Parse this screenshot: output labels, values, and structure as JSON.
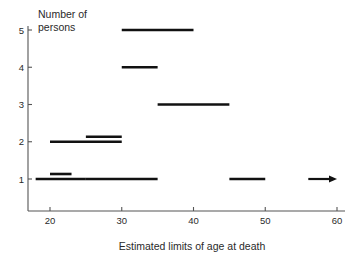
{
  "chart_data": {
    "type": "bar",
    "title": "",
    "xlabel": "Estimated limits of age at death",
    "ylabel": "Number of persons",
    "xlim": [
      16,
      62
    ],
    "ylim": [
      0,
      5.4
    ],
    "grid": false,
    "legend": null,
    "xticks": [
      20,
      30,
      40,
      50,
      60
    ],
    "xtick_labels": [
      "20",
      "30",
      "40",
      "50",
      "60"
    ],
    "yticks": [
      1,
      2,
      3,
      4,
      5
    ],
    "ytick_labels": [
      "1",
      "2",
      "3",
      "4",
      "5"
    ],
    "orientation": "horizontal-range-bars",
    "segments": [
      {
        "persons": 5,
        "age_low": 30,
        "age_high": 40,
        "open_ended": false,
        "offset": 0
      },
      {
        "persons": 4,
        "age_low": 30,
        "age_high": 35,
        "open_ended": false,
        "offset": 0
      },
      {
        "persons": 3,
        "age_low": 35,
        "age_high": 45,
        "open_ended": false,
        "offset": 0
      },
      {
        "persons": 2,
        "age_low": 20,
        "age_high": 30,
        "open_ended": false,
        "offset": 0
      },
      {
        "persons": 2,
        "age_low": 25,
        "age_high": 30,
        "open_ended": false,
        "offset": 1
      },
      {
        "persons": 1,
        "age_low": 18,
        "age_high": 25,
        "open_ended": false,
        "offset": 0
      },
      {
        "persons": 1,
        "age_low": 20,
        "age_high": 23,
        "open_ended": false,
        "offset": 1
      },
      {
        "persons": 1,
        "age_low": 25,
        "age_high": 35,
        "open_ended": false,
        "offset": 0
      },
      {
        "persons": 1,
        "age_low": 45,
        "age_high": 50,
        "open_ended": false,
        "offset": 0
      },
      {
        "persons": 1,
        "age_low": 56,
        "age_high": 60,
        "open_ended": true,
        "offset": 0
      }
    ],
    "ylabel_lines": [
      "Number of",
      "persons"
    ],
    "colors": {
      "segment": "#111111",
      "axis": "#555555",
      "text": "#2a2a2a",
      "background": "#ffffff"
    }
  }
}
